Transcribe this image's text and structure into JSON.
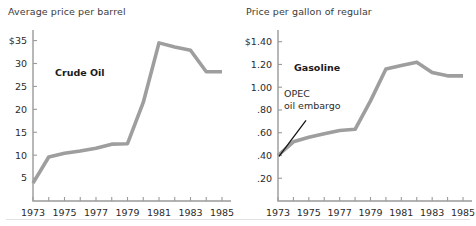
{
  "figure": {
    "background_color": "#ffffff",
    "line_color": "#9e9e9e",
    "axis_color": "#9a9a9a",
    "text_color": "#2b2b2b"
  },
  "chart_data": [
    {
      "type": "line",
      "title": "Average price per barrel",
      "series_label": "Crude Oil",
      "xlabel": "",
      "ylabel": "",
      "grid": false,
      "legend_position": "inside-plot",
      "xlim": [
        1973,
        1985
      ],
      "ylim": [
        0,
        36
      ],
      "x_tick_labels": [
        "1973",
        "1975",
        "1977",
        "1979",
        "1981",
        "1983",
        "1985"
      ],
      "x_tick_values": [
        1973,
        1975,
        1977,
        1979,
        1981,
        1983,
        1985
      ],
      "x_minor_ticks": [
        1974,
        1976,
        1978,
        1980,
        1982,
        1984
      ],
      "y_tick_labels": [
        "$35",
        "30",
        "25",
        "20",
        "15",
        "10",
        "5"
      ],
      "y_tick_values": [
        35,
        30,
        25,
        20,
        15,
        10,
        5
      ],
      "x": [
        1973,
        1974,
        1975,
        1976,
        1977,
        1978,
        1979,
        1980,
        1981,
        1982,
        1983,
        1984,
        1985
      ],
      "values": [
        3.9,
        9.6,
        10.4,
        10.9,
        11.5,
        12.4,
        12.5,
        21.5,
        34.5,
        33.6,
        32.9,
        28.2,
        28.2
      ],
      "annotations": []
    },
    {
      "type": "line",
      "title": "Price per gallon of regular",
      "series_label": "Gasoline",
      "xlabel": "",
      "ylabel": "",
      "grid": false,
      "legend_position": "inside-plot",
      "xlim": [
        1973,
        1985
      ],
      "ylim": [
        0,
        1.45
      ],
      "x_tick_labels": [
        "1973",
        "1975",
        "1977",
        "1979",
        "1981",
        "1983",
        "1985"
      ],
      "x_tick_values": [
        1973,
        1975,
        1977,
        1979,
        1981,
        1983,
        1985
      ],
      "x_minor_ticks": [
        1974,
        1976,
        1978,
        1980,
        1982,
        1984
      ],
      "y_tick_labels": [
        "$1.40",
        "1.20",
        "1.00",
        ".80",
        ".60",
        ".40",
        ".20"
      ],
      "y_tick_values": [
        1.4,
        1.2,
        1.0,
        0.8,
        0.6,
        0.4,
        0.2
      ],
      "x": [
        1973,
        1974,
        1975,
        1976,
        1977,
        1978,
        1979,
        1980,
        1981,
        1982,
        1983,
        1984,
        1985
      ],
      "values": [
        0.4,
        0.52,
        0.56,
        0.59,
        0.62,
        0.63,
        0.88,
        1.16,
        1.19,
        1.22,
        1.13,
        1.1,
        1.1
      ],
      "annotations": [
        {
          "label_line1": "OPEC",
          "label_line2": "oil embargo",
          "points_to_year": 1973,
          "points_to_value": 0.4
        }
      ]
    }
  ]
}
